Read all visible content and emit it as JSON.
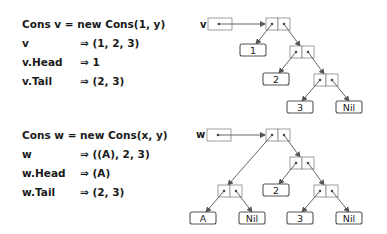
{
  "example_v": {
    "lines": [
      {
        "lhs": "Cons v = new Cons(1, y)",
        "rhs": ""
      },
      {
        "lhs": "v",
        "rhs": "⇒ (1, 2, 3)"
      },
      {
        "lhs": "v.Head",
        "rhs": "⇒ 1"
      },
      {
        "lhs": "v.Tail",
        "rhs": "⇒ (2, 3)"
      }
    ],
    "diagram": {
      "var_label": "v",
      "leaves": [
        "1",
        "2",
        "3",
        "Nil"
      ]
    }
  },
  "example_w": {
    "lines": [
      {
        "lhs": "Cons w = new Cons(x, y)",
        "rhs": ""
      },
      {
        "lhs": "w",
        "rhs": "⇒ ((A), 2, 3)"
      },
      {
        "lhs": "w.Head",
        "rhs": "⇒ (A)"
      },
      {
        "lhs": "w.Tail",
        "rhs": "⇒ (2, 3)"
      }
    ],
    "diagram": {
      "var_label": "w",
      "leaves": [
        "A",
        "Nil",
        "2",
        "3",
        "Nil"
      ]
    }
  },
  "colors": {
    "text": "#1a1a1a",
    "line": "#555555",
    "box_border": "#777777"
  }
}
